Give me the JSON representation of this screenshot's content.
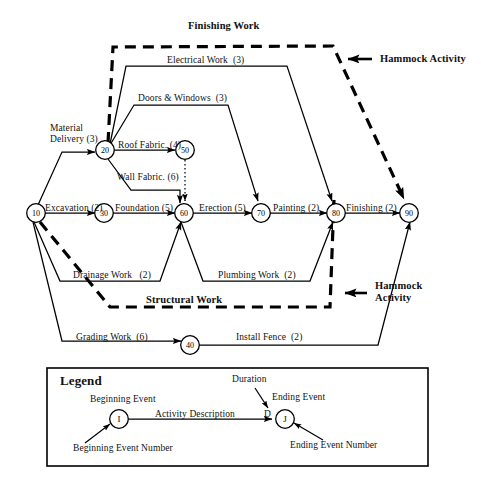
{
  "diagram": {
    "type": "activity-on-arrow-network",
    "title_top": "Finishing Work",
    "title_mid": "Structural Work",
    "annotation_top": "Hammock Activity",
    "annotation_bottom_line1": "Hammock",
    "annotation_bottom_line2": "Activity"
  },
  "nodes": [
    {
      "id": "n10",
      "label": "10",
      "x": 36,
      "y": 213
    },
    {
      "id": "n20",
      "label": "20",
      "x": 105,
      "y": 150
    },
    {
      "id": "n30",
      "label": "30",
      "x": 104,
      "y": 213
    },
    {
      "id": "n40",
      "label": "40",
      "x": 190,
      "y": 345
    },
    {
      "id": "n50",
      "label": "50",
      "x": 185,
      "y": 150
    },
    {
      "id": "n60",
      "label": "60",
      "x": 184,
      "y": 213
    },
    {
      "id": "n70",
      "label": "70",
      "x": 261,
      "y": 213
    },
    {
      "id": "n80",
      "label": "80",
      "x": 336,
      "y": 213
    },
    {
      "id": "n90",
      "label": "90",
      "x": 409,
      "y": 213
    }
  ],
  "activities": [
    {
      "name": "Material Delivery",
      "duration": "(3)",
      "from": "10",
      "to": "20",
      "text": "Material\nDelivery (3)"
    },
    {
      "name": "Roof Fabric.",
      "duration": "(4)",
      "from": "20",
      "to": "50",
      "text": "Roof Fabric. (4)"
    },
    {
      "name": "Wall Fabric.",
      "duration": "(6)",
      "from": "20",
      "to": "60",
      "text": "Wall Fabric. (6)"
    },
    {
      "name": "Electrical Work",
      "duration": "(3)",
      "from": "20",
      "to": "80",
      "text": "Electrical Work  (3)"
    },
    {
      "name": "Doors & Windows",
      "duration": "(3)",
      "from": "20",
      "to": "70",
      "text": "Doors & Windows  (3)"
    },
    {
      "name": "Excavation",
      "duration": "(2)",
      "from": "10",
      "to": "30",
      "text": "Excavation (2)"
    },
    {
      "name": "Foundation",
      "duration": "(5)",
      "from": "30",
      "to": "60",
      "text": "Foundation (5)"
    },
    {
      "name": "Erection",
      "duration": "(5)",
      "from": "60",
      "to": "70",
      "text": "Erection (5)"
    },
    {
      "name": "Painting",
      "duration": "(2)",
      "from": "70",
      "to": "80",
      "text": "Painting (2)"
    },
    {
      "name": "Finishing",
      "duration": "(2)",
      "from": "80",
      "to": "90",
      "text": "Finishing (2)"
    },
    {
      "name": "Drainage Work",
      "duration": "(2)",
      "from": "10",
      "to": "60",
      "text": "Drainage Work   (2)"
    },
    {
      "name": "Plumbing Work",
      "duration": "(2)",
      "from": "60",
      "to": "80",
      "text": "Plumbing Work  (2)"
    },
    {
      "name": "Grading Work",
      "duration": "(6)",
      "from": "10",
      "to": "40",
      "text": "Grading Work  (6)"
    },
    {
      "name": "Install Fence",
      "duration": "(2)",
      "from": "40",
      "to": "90",
      "text": "Install Fence  (2)"
    },
    {
      "name": "dummy",
      "duration": "",
      "from": "50",
      "to": "60",
      "text": ""
    }
  ],
  "hammocks": [
    {
      "name": "Finishing Work",
      "from": "20",
      "to": "90"
    },
    {
      "name": "Structural Work",
      "from": "10",
      "to": "80"
    }
  ],
  "legend": {
    "title": "Legend",
    "beginning_event": "Beginning Event",
    "ending_event": "Ending Event",
    "duration": "Duration",
    "activity_description": "Activity Description",
    "beginning_event_number": "Beginning Event Number",
    "ending_event_number": "Ending Event Number",
    "begin_node": "I",
    "end_node": "J",
    "duration_symbol": "D"
  },
  "colors": {
    "ink": "#000000",
    "background": "#ffffff"
  }
}
